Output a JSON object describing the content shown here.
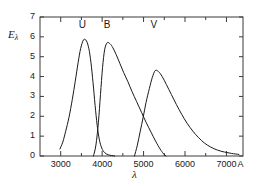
{
  "chart_data": {
    "type": "line",
    "title": "",
    "subtitle": "",
    "xlabel": "λ",
    "ylabel": "Eλ",
    "ylabel_base": "E",
    "ylabel_sub": "λ",
    "x_unit": "A",
    "xlim": [
      2500,
      7400
    ],
    "ylim": [
      0,
      7
    ],
    "grid": false,
    "legend_position": "inline-above-curves",
    "x_major_ticks": [
      3000,
      4000,
      5000,
      6000,
      7000
    ],
    "x_major_tick_labels": [
      "3000",
      "4000",
      "5000",
      "6000",
      "7000"
    ],
    "x_minor_ticks": [
      3500,
      4500,
      5500,
      6500
    ],
    "y_ticks": [
      0,
      1,
      2,
      3,
      4,
      5,
      6,
      7
    ],
    "y_tick_labels": [
      "0",
      "1",
      "2",
      "3",
      "4",
      "5",
      "6",
      "7"
    ],
    "axis_color": "#3a3a3a",
    "curve_color": "#1a1a1a",
    "background_color": "#ffffff",
    "annotations": [
      {
        "text": "U",
        "x": 3520,
        "y": 6.55
      },
      {
        "text": "B",
        "x": 4120,
        "y": 6.55
      },
      {
        "text": "V",
        "x": 5250,
        "y": 6.55
      }
    ],
    "series": [
      {
        "name": "U",
        "label": "U",
        "peak_x": 3550,
        "peak_y": 5.85,
        "x": [
          2980,
          3050,
          3120,
          3200,
          3280,
          3350,
          3420,
          3480,
          3550,
          3620,
          3680,
          3730,
          3780,
          3830,
          3880,
          3930,
          3990,
          4060,
          4150,
          4300
        ],
        "values": [
          0.35,
          0.7,
          1.25,
          1.95,
          2.85,
          3.75,
          4.7,
          5.4,
          5.85,
          5.8,
          5.4,
          4.7,
          3.7,
          2.55,
          1.55,
          0.85,
          0.4,
          0.17,
          0.06,
          0.0
        ]
      },
      {
        "name": "B",
        "label": "B",
        "peak_x": 4120,
        "peak_y": 5.7,
        "x": [
          3790,
          3850,
          3910,
          3960,
          4010,
          4060,
          4120,
          4190,
          4260,
          4340,
          4430,
          4520,
          4620,
          4720,
          4830,
          4950,
          5060,
          5180,
          5290,
          5400,
          5480,
          5540
        ],
        "values": [
          0.0,
          0.55,
          1.7,
          3.1,
          4.45,
          5.35,
          5.7,
          5.65,
          5.45,
          5.1,
          4.65,
          4.2,
          3.75,
          3.25,
          2.75,
          2.2,
          1.7,
          1.2,
          0.75,
          0.35,
          0.12,
          0.0
        ]
      },
      {
        "name": "V",
        "label": "V",
        "peak_x": 5280,
        "peak_y": 4.3,
        "x": [
          4780,
          4850,
          4920,
          4990,
          5060,
          5140,
          5210,
          5280,
          5360,
          5450,
          5550,
          5670,
          5790,
          5920,
          6050,
          6190,
          6330,
          6470,
          6620,
          6780,
          6950,
          7120,
          7300
        ],
        "values": [
          0.0,
          0.55,
          1.25,
          1.95,
          2.7,
          3.4,
          3.95,
          4.3,
          4.25,
          4.0,
          3.6,
          3.1,
          2.6,
          2.1,
          1.65,
          1.25,
          0.92,
          0.65,
          0.45,
          0.3,
          0.2,
          0.13,
          0.08
        ]
      }
    ]
  }
}
